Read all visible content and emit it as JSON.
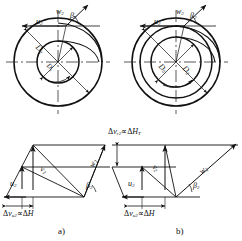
{
  "figure": {
    "type": "engineering-diagram",
    "panels": [
      {
        "id": "a",
        "caption": "a)"
      },
      {
        "id": "b",
        "caption": "b)"
      }
    ]
  },
  "impeller_a": {
    "circles": [
      {
        "name": "outer",
        "label": "D",
        "sub": "2"
      },
      {
        "name": "inner",
        "label": "D",
        "sub": "1"
      }
    ],
    "diameter_outer": {
      "symbol": "D",
      "sub": "2"
    },
    "diameter_inner": {
      "symbol": "D",
      "sub": "1"
    },
    "velocity_u": {
      "symbol": "u",
      "sub": "2"
    },
    "velocity_w": {
      "symbol": "w",
      "sub": "2"
    },
    "angle_beta": {
      "symbol": "β",
      "sub": "2"
    }
  },
  "impeller_b": {
    "circles": [
      {
        "name": "outer",
        "label": "D",
        "sub": "2"
      },
      {
        "name": "middle",
        "label": "D",
        "sub": "2"
      },
      {
        "name": "inner",
        "label": "D",
        "sub": "0"
      }
    ],
    "diameter_outer": {
      "symbol": "D",
      "sub": "2"
    },
    "diameter_inner": {
      "symbol": "D",
      "sub": "0"
    },
    "velocity_u": {
      "symbol": "u",
      "sub": "2"
    },
    "velocity_w": {
      "symbol": "w",
      "sub": "2"
    },
    "angle_beta": {
      "symbol": "β",
      "sub": "2"
    }
  },
  "triangle_a": {
    "velocity_u": {
      "symbol": "u",
      "sub": "2"
    },
    "velocity_v": {
      "symbol": "v",
      "sub": "2"
    },
    "velocity_w": {
      "symbol": "w",
      "sub": "2"
    },
    "angle_beta": {
      "symbol": "β",
      "sub": "2"
    },
    "delta_annotation": {
      "delta": "Δ",
      "symbol": "v",
      "sub": "u2",
      "relation": "∝",
      "target_delta": "Δ",
      "target": "H"
    },
    "caption": "a)"
  },
  "triangle_b": {
    "velocity_u": {
      "symbol": "u",
      "sub": "2"
    },
    "velocity_v": {
      "symbol": "v",
      "sub": "2"
    },
    "velocity_w": {
      "symbol": "w",
      "sub": "2"
    },
    "angle_beta": {
      "symbol": "β",
      "sub": "2"
    },
    "delta_annotation": {
      "delta": "Δ",
      "symbol": "v",
      "sub": "u2",
      "relation": "∝",
      "target_delta": "Δ",
      "target": "H"
    },
    "caption": "b)"
  },
  "radial_annotation": {
    "delta": "Δ",
    "symbol": "v",
    "sub": "r2",
    "relation": "∝",
    "target_delta": "Δ",
    "target": "H",
    "target_sub": "T"
  },
  "colors": {
    "line": "#111111",
    "background": "#ffffff"
  }
}
